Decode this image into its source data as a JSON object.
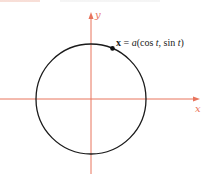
{
  "figure": {
    "axes": {
      "x_label": "x",
      "y_label": "y"
    },
    "curve": {
      "type": "circle",
      "description": "circle of radius a centered at origin"
    },
    "point_label": {
      "vector": "x",
      "equals": " = ",
      "a": "a",
      "open": "(cos ",
      "t1": "t",
      "mid": ", sin ",
      "t2": "t",
      "close": ")"
    },
    "point_angle_deg": 67,
    "colors": {
      "axis": "#e8745c",
      "curve": "#1a1a1a"
    }
  }
}
